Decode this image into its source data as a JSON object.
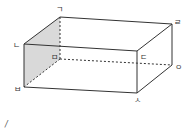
{
  "diagram": {
    "vertices": {
      "giyeok": {
        "label": "ㄱ",
        "x": 60,
        "y": 17
      },
      "rieul": {
        "label": "ㄹ",
        "x": 172,
        "y": 24
      },
      "nieun": {
        "label": "ㄴ",
        "x": 24,
        "y": 44
      },
      "digeut": {
        "label": "ㄷ",
        "x": 137,
        "y": 51
      },
      "mieum": {
        "label": "ㅁ",
        "x": 60,
        "y": 59
      },
      "ieung": {
        "label": "ㅇ",
        "x": 172,
        "y": 65
      },
      "bieup": {
        "label": "ㅂ",
        "x": 24,
        "y": 87
      },
      "siot": {
        "label": "ㅅ",
        "x": 137,
        "y": 93
      }
    },
    "shaded_face": "ㄱㄴㅂㅁ",
    "hidden_edges": [
      "ㄱㅁ",
      "ㅁㅂ",
      "ㅁㅇ"
    ],
    "colors": {
      "edge": "#333333",
      "shade": "#d9d9d9"
    },
    "footnote_mark": "/"
  }
}
